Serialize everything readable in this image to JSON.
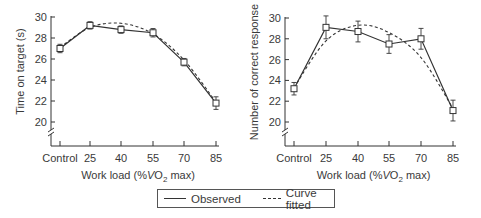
{
  "chart_data": [
    {
      "type": "line",
      "title": "",
      "xlabel": "Work load (%VO2 max)",
      "ylabel": "Time on target (s)",
      "categories": [
        "Control",
        "25",
        "40",
        "55",
        "70",
        "85"
      ],
      "yticks": [
        "20",
        "22",
        "24",
        "26",
        "28",
        "30"
      ],
      "ylim": [
        20,
        30
      ],
      "y_axis_break": true,
      "series": [
        {
          "name": "Observed",
          "style": "solid",
          "marker": "open-square",
          "values": [
            27.0,
            29.2,
            28.8,
            28.5,
            25.7,
            21.8
          ],
          "error": [
            0.4,
            0.35,
            0.35,
            0.4,
            0.35,
            0.6
          ]
        },
        {
          "name": "Curve fitted",
          "style": "dashed",
          "values": [
            27.1,
            29.0,
            29.4,
            28.4,
            25.9,
            21.9
          ]
        }
      ]
    },
    {
      "type": "line",
      "title": "",
      "xlabel": "Work load (%VO2 max)",
      "ylabel": "Number of correct response",
      "categories": [
        "Control",
        "25",
        "40",
        "55",
        "70",
        "85"
      ],
      "yticks": [
        "20",
        "22",
        "24",
        "26",
        "28",
        "30"
      ],
      "ylim": [
        20,
        30
      ],
      "y_axis_break": true,
      "series": [
        {
          "name": "Observed",
          "style": "solid",
          "marker": "open-square",
          "values": [
            23.2,
            29.1,
            28.7,
            27.5,
            28.0,
            21.1
          ],
          "error": [
            0.6,
            1.1,
            1.0,
            0.9,
            1.0,
            1.0
          ]
        },
        {
          "name": "Curve fitted",
          "style": "dashed",
          "values": [
            23.3,
            27.8,
            29.3,
            28.6,
            26.2,
            21.3
          ]
        }
      ]
    }
  ],
  "legend": {
    "observed_label": "Observed",
    "fitted_label": "Curve fitted"
  },
  "left_chart": {
    "ylabel": "Time on target (s)",
    "xlabel_prefix": "Work load (%",
    "xlabel_v": "V",
    "xlabel_o": "O",
    "xlabel_sub": "2",
    "xlabel_suffix": " max)",
    "yticks": [
      "30",
      "28",
      "26",
      "24",
      "22",
      "20"
    ],
    "xticks": [
      "Control",
      "25",
      "40",
      "55",
      "70",
      "85"
    ]
  },
  "right_chart": {
    "ylabel": "Number of correct response",
    "xlabel_prefix": "Work load (%",
    "xlabel_v": "V",
    "xlabel_o": "O",
    "xlabel_sub": "2",
    "xlabel_suffix": " max)",
    "yticks": [
      "30",
      "28",
      "26",
      "24",
      "22",
      "20"
    ],
    "xticks": [
      "Control",
      "25",
      "40",
      "55",
      "70",
      "85"
    ]
  }
}
